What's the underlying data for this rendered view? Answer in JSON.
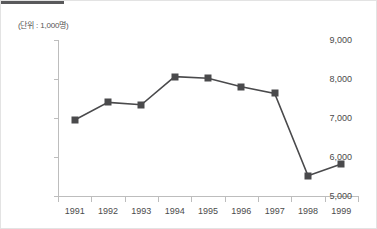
{
  "figure": {
    "unit_label": "(단위 : 1,000명)",
    "accent_color": "#4a4a4c",
    "axis_color": "#bdbdbd",
    "rule_color": "#59595b"
  },
  "chart_data": {
    "type": "line",
    "title": "",
    "xlabel": "",
    "ylabel": "",
    "unit_note": "(단위 : 1,000명)",
    "categories": [
      "1991",
      "1992",
      "1993",
      "1994",
      "1995",
      "1996",
      "1997",
      "1998",
      "1999"
    ],
    "values": [
      6950,
      7400,
      7340,
      8060,
      8020,
      7800,
      7630,
      5520,
      5820
    ],
    "series": [
      {
        "name": "",
        "values": [
          6950,
          7400,
          7340,
          8060,
          8020,
          7800,
          7630,
          5520,
          5820
        ]
      }
    ],
    "ylim": [
      5000,
      9000
    ],
    "yticks": [
      9000,
      8000,
      7000,
      6000,
      5000
    ],
    "ytick_labels": [
      "9,000",
      "8,000",
      "7,000",
      "6,000",
      "5,000"
    ],
    "grid": false,
    "legend": false,
    "marker": "square",
    "line_color": "#4a4a4c"
  }
}
